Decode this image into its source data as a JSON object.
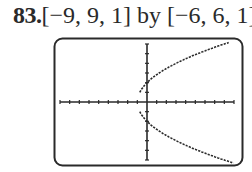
{
  "problem": {
    "number": "83.",
    "window_text": "[−9, 9, 1] by [−6, 6, 1]"
  },
  "colors": {
    "ink": "#2a2a2a",
    "background": "#ffffff"
  },
  "chart_data": {
    "type": "line",
    "xlabel": "",
    "ylabel": "",
    "xlim": [
      -9,
      9
    ],
    "ylim": [
      -6,
      6
    ],
    "xscale_tick": 1,
    "yscale_tick": 1,
    "grid": false,
    "legend": null,
    "series": [
      {
        "name": "upper branch",
        "x": [
          -1,
          -0.5,
          0,
          1,
          2,
          3,
          4,
          5,
          6,
          7,
          8,
          8.5
        ],
        "y": [
          0,
          1.41,
          2.0,
          2.83,
          3.46,
          4.0,
          4.47,
          4.9,
          5.29,
          5.66,
          6.0,
          6.16
        ]
      },
      {
        "name": "lower branch",
        "x": [
          -1,
          -0.5,
          0,
          1,
          2,
          3,
          4,
          5,
          6,
          7,
          8,
          9
        ],
        "y": [
          0,
          -1.41,
          -2.0,
          -2.83,
          -3.46,
          -4.0,
          -4.47,
          -4.9,
          -5.29,
          -5.66,
          -6.0,
          -6.32
        ]
      }
    ]
  }
}
